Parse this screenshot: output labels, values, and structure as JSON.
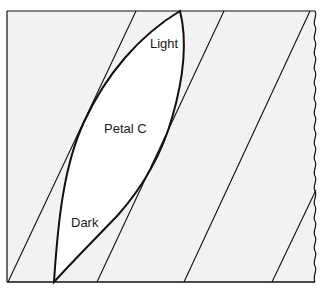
{
  "diagram": {
    "labels": {
      "top": "Light",
      "center": "Petal C",
      "bottom": "Dark"
    },
    "colors": {
      "background": "#f2f2f2",
      "petal_fill": "#ffffff",
      "stroke": "#111111",
      "text": "#1a1a1a"
    },
    "frame": {
      "left": 7,
      "top": 11,
      "bottom": 282,
      "right_wavy_x": 315
    },
    "diagonal_lines": [
      {
        "x1": 8,
        "y1": 282,
        "x2": 136,
        "y2": 11
      },
      {
        "x1": 97,
        "y1": 282,
        "x2": 224,
        "y2": 11
      },
      {
        "x1": 184,
        "y1": 282,
        "x2": 310,
        "y2": 11
      },
      {
        "x1": 272,
        "y1": 282,
        "x2": 316,
        "y2": 190
      }
    ],
    "petal": {
      "top_tip": [
        180,
        11
      ],
      "bottom_tip": [
        54,
        282
      ]
    }
  }
}
